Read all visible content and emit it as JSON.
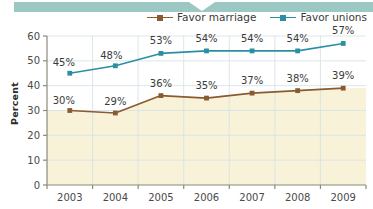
{
  "banner": {
    "name": "top-teal-banner",
    "color": "#9cc8c4"
  },
  "legend": {
    "position": "top-right",
    "items": [
      {
        "label": "Favor marriage",
        "color": "#8a5a30",
        "marker": "square"
      },
      {
        "label": "Favor unions",
        "color": "#2b8fa3",
        "marker": "square"
      }
    ]
  },
  "chart_data": {
    "type": "line",
    "title": "",
    "xlabel": "",
    "ylabel": "Percent",
    "categories": [
      "2003",
      "2004",
      "2005",
      "2006",
      "2007",
      "2008",
      "2009"
    ],
    "ylim": [
      0,
      60
    ],
    "yticks": [
      0,
      10,
      20,
      30,
      40,
      50,
      60
    ],
    "ytick_labels": [
      "0",
      "10",
      "20",
      "30",
      "40",
      "50",
      "60"
    ],
    "grid": true,
    "legend_position": "top-right",
    "series": [
      {
        "name": "Favor marriage",
        "color": "#8a5a30",
        "values": [
          30,
          29,
          36,
          35,
          37,
          38,
          39
        ],
        "data_labels": [
          "30%",
          "29%",
          "36%",
          "35%",
          "37%",
          "38%",
          "39%"
        ]
      },
      {
        "name": "Favor unions",
        "color": "#2b8fa3",
        "values": [
          45,
          48,
          53,
          54,
          54,
          54,
          57
        ],
        "data_labels": [
          "45%",
          "48%",
          "53%",
          "54%",
          "54%",
          "54%",
          "57%"
        ]
      }
    ],
    "plot_bg_upper": "#ffffff",
    "plot_bg_lower": "#f7f2d8",
    "gridline_color": "#d8e3e8"
  }
}
